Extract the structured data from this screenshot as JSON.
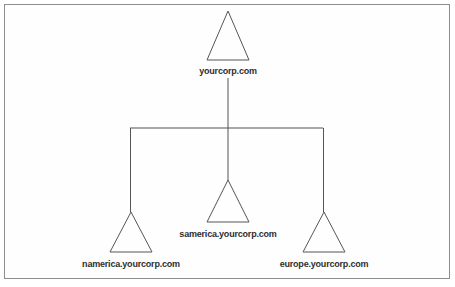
{
  "diagram": {
    "type": "tree",
    "background_color": "#ffffff",
    "frame_color": "#8d8d8d",
    "line_color": "#555555",
    "label_color": "#2e2e2e",
    "root": {
      "id": "root",
      "label": "yourcorp.com",
      "shape": "triangle",
      "apex_x": 228,
      "apex_y": 11,
      "base_y": 60,
      "half_width": 21,
      "label_x": 228,
      "label_y": 66
    },
    "children": [
      {
        "id": "namerica",
        "label": "namerica.yourcorp.com",
        "shape": "triangle",
        "apex_x": 131,
        "apex_y": 212,
        "base_y": 252,
        "half_width": 21,
        "label_x": 131,
        "label_y": 259
      },
      {
        "id": "samerica",
        "label": "samerica.yourcorp.com",
        "shape": "triangle",
        "apex_x": 228,
        "apex_y": 180,
        "base_y": 222,
        "half_width": 21,
        "label_x": 228,
        "label_y": 229
      },
      {
        "id": "europe",
        "label": "europe.yourcorp.com",
        "shape": "triangle",
        "apex_x": 324,
        "apex_y": 212,
        "base_y": 252,
        "half_width": 21,
        "label_x": 324,
        "label_y": 259
      }
    ],
    "connectors": {
      "bus_y": 128,
      "bus_left_x": 130,
      "bus_right_x": 323,
      "trunk_x": 228,
      "trunk_top_y": 78,
      "trunk_bottom_y": 180
    }
  }
}
